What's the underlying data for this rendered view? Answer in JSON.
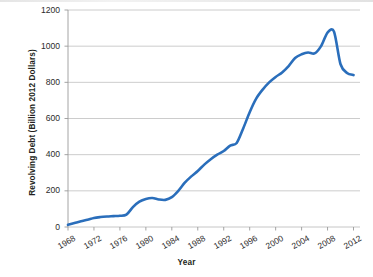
{
  "chart_data": {
    "type": "line",
    "title": "",
    "xlabel": "Year",
    "ylabel": "Revolving Debt (Billion 2012 Dollars)",
    "xlim": [
      1968,
      2013
    ],
    "ylim": [
      0,
      1200
    ],
    "grid": true,
    "legend": false,
    "series_color": "#2A6EBB",
    "gridline_color": "#BFBFBF",
    "axis_color": "#9A9A9A",
    "background_color": "#FFFFFF",
    "ytick_labels": [
      "0",
      "200",
      "400",
      "600",
      "800",
      "1000",
      "1200"
    ],
    "ytick_values": [
      0,
      200,
      400,
      600,
      800,
      1000,
      1200
    ],
    "xtick_labels": [
      "1968",
      "1972",
      "1976",
      "1980",
      "1984",
      "1988",
      "1992",
      "1996",
      "2000",
      "2004",
      "2008",
      "2012"
    ],
    "xtick_values": [
      1968,
      1972,
      1976,
      1980,
      1984,
      1988,
      1992,
      1996,
      2000,
      2004,
      2008,
      2012
    ],
    "series": [
      {
        "name": "Revolving Debt",
        "x": [
          1968,
          1969,
          1970,
          1971,
          1972,
          1973,
          1974,
          1975,
          1976,
          1977,
          1978,
          1979,
          1980,
          1981,
          1982,
          1983,
          1984,
          1985,
          1986,
          1987,
          1988,
          1989,
          1990,
          1991,
          1992,
          1993,
          1994,
          1995,
          1996,
          1997,
          1998,
          1999,
          2000,
          2001,
          2002,
          2003,
          2004,
          2005,
          2006,
          2007,
          2008,
          2009,
          2010,
          2011,
          2012
        ],
        "values": [
          12,
          22,
          32,
          40,
          50,
          55,
          58,
          60,
          62,
          68,
          110,
          140,
          155,
          160,
          152,
          150,
          165,
          200,
          245,
          280,
          310,
          345,
          375,
          400,
          420,
          450,
          465,
          545,
          635,
          710,
          760,
          800,
          830,
          855,
          890,
          935,
          955,
          965,
          960,
          1000,
          1075,
          1080,
          900,
          852,
          840
        ],
        "units": "Billion 2012 Dollars",
        "annotations": [
          {
            "label": "peak",
            "x": 2009,
            "y": 1080
          },
          {
            "label": "final",
            "x": 2012,
            "y": 840
          },
          {
            "label": "start",
            "x": 1968,
            "y": 12
          }
        ]
      }
    ]
  }
}
